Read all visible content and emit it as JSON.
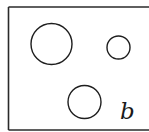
{
  "figure": {
    "label": "b",
    "frame": {
      "left": 8.5,
      "top": 7,
      "right": 149,
      "bottom": 130,
      "color": "#2a2a2a"
    },
    "circles": [
      {
        "name": "large-circle",
        "cx": 51.5,
        "cy": 44,
        "r": 20.5
      },
      {
        "name": "small-circle",
        "cx": 118.5,
        "cy": 47.5,
        "r": 11.5
      },
      {
        "name": "medium-circle",
        "cx": 84.5,
        "cy": 102,
        "r": 16.5
      }
    ]
  }
}
